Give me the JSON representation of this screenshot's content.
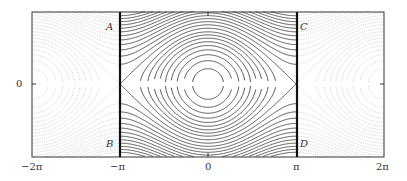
{
  "chart_data": {
    "type": "line",
    "title": "",
    "xlabel": "",
    "ylabel": "",
    "xlim": [
      "-2π",
      "2π"
    ],
    "ylim": [
      -2.6,
      2.6
    ],
    "x_ticks": [
      "−2π",
      "−π",
      "0",
      "π",
      "2π"
    ],
    "y_ticks": [
      "0"
    ],
    "grid": false,
    "legend": null,
    "vertical_lines": [
      {
        "x": "−π",
        "style": "thick solid"
      },
      {
        "x": "π",
        "style": "thick solid"
      }
    ],
    "corner_labels": [
      {
        "label": "A",
        "position": "top, right of -π line... left of -π line"
      },
      {
        "label": "B",
        "position": "bottom, left of -π line"
      },
      {
        "label": "C",
        "position": "top, right of π line"
      },
      {
        "label": "D",
        "position": "bottom, right of π line"
      }
    ],
    "energy_levels": [
      -0.85,
      -0.65,
      -0.45,
      -0.25,
      -0.05,
      0.15,
      0.35,
      0.55,
      0.75,
      1.0,
      1.25,
      1.5,
      1.75,
      2.0,
      2.25,
      2.5,
      2.75,
      3.0,
      3.25,
      3.5,
      3.75,
      4.0
    ],
    "separatrix_level": 1.0,
    "series": [
      {
        "name": "solid contours",
        "region": "[-π, π]",
        "color": "#333333"
      },
      {
        "name": "dotted contours",
        "region": "[-2π,-π] ∪ [π,2π]",
        "color": "#bbbbbb"
      }
    ]
  },
  "labels": {
    "x_m2pi": "−2π",
    "x_mpi": "−π",
    "x_0": "0",
    "x_pi": "π",
    "x_2pi": "2π",
    "y_0": "0",
    "A": "A",
    "B": "B",
    "C": "C",
    "D": "D"
  }
}
